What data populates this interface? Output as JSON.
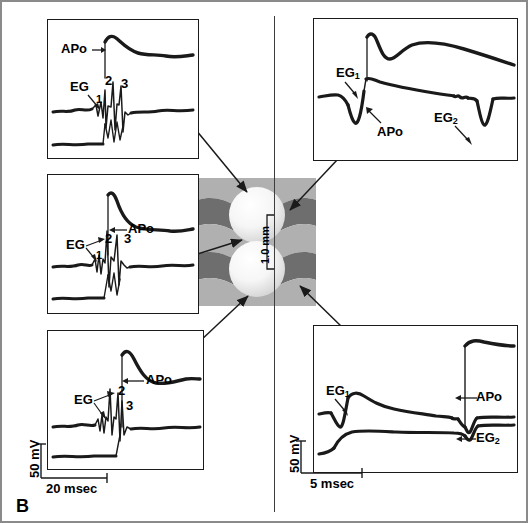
{
  "figure": {
    "panel_letter": "B",
    "divider": "vertical-separator"
  },
  "center_diagram": {
    "name": "myocardium-electrode-schematic",
    "scale_label": "1.0 mm",
    "bands": [
      "light-gray",
      "dark-gray",
      "light-gray",
      "dark-gray",
      "light-gray"
    ],
    "electrodes": [
      "upper-sphere",
      "lower-sphere"
    ],
    "colors": {
      "band_light": "#b0b0b0",
      "band_dark": "#6e6e6e",
      "sphere": "#f2f2f2",
      "outline": "#1a1a1a"
    }
  },
  "panels": {
    "top_left": {
      "id": "top-left-recording",
      "traces": [
        "action-potential",
        "electrogram",
        "baseline"
      ],
      "annotations": [
        {
          "text": "APo",
          "name": "apo-label"
        },
        {
          "text": "EG",
          "name": "eg-label"
        },
        {
          "text": "1",
          "name": "deflection-1"
        },
        {
          "text": "2",
          "name": "deflection-2"
        },
        {
          "text": "3",
          "name": "deflection-3"
        }
      ]
    },
    "middle_left": {
      "id": "middle-left-recording",
      "traces": [
        "action-potential",
        "electrogram",
        "baseline"
      ],
      "annotations": [
        {
          "text": "APo",
          "name": "apo-label"
        },
        {
          "text": "EG",
          "name": "eg-label"
        },
        {
          "text": "1",
          "name": "deflection-1"
        },
        {
          "text": "2",
          "name": "deflection-2"
        },
        {
          "text": "3",
          "name": "deflection-3"
        }
      ]
    },
    "bottom_left": {
      "id": "bottom-left-recording",
      "traces": [
        "action-potential",
        "electrogram",
        "baseline"
      ],
      "annotations": [
        {
          "text": "APo",
          "name": "apo-label"
        },
        {
          "text": "EG",
          "name": "eg-label"
        },
        {
          "text": "2",
          "name": "deflection-2"
        },
        {
          "text": "3",
          "name": "deflection-3"
        }
      ]
    },
    "top_right": {
      "id": "top-right-recording",
      "traces": [
        "action-potential",
        "electrogram"
      ],
      "annotations": [
        {
          "text": "EG",
          "sub": "1",
          "name": "eg1-label"
        },
        {
          "text": "APo",
          "name": "apo-label"
        },
        {
          "text": "EG",
          "sub": "2",
          "name": "eg2-label"
        }
      ]
    },
    "bottom_right": {
      "id": "bottom-right-recording",
      "traces": [
        "action-potential",
        "electrogram"
      ],
      "annotations": [
        {
          "text": "EG",
          "sub": "1",
          "name": "eg1-label"
        },
        {
          "text": "APo",
          "name": "apo-label"
        },
        {
          "text": "EG",
          "sub": "2",
          "name": "eg2-label"
        }
      ]
    }
  },
  "scale_bars": {
    "left": {
      "voltage": "50 mV",
      "time": "20 msec"
    },
    "right": {
      "voltage": "50 mV",
      "time": "5 msec"
    }
  }
}
